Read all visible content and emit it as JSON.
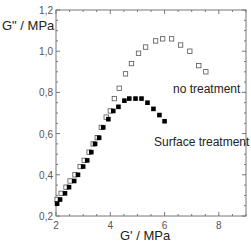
{
  "chart_data": {
    "type": "scatter",
    "title": "",
    "xlabel": "G' / MPa",
    "ylabel": "G\" / MPa",
    "xlim": [
      2,
      9
    ],
    "ylim": [
      0.2,
      1.2
    ],
    "xticks": [
      2,
      4,
      6,
      8
    ],
    "xtick_labels": [
      "2",
      "4",
      "6",
      "8"
    ],
    "yticks": [
      0.2,
      0.4,
      0.6,
      0.8,
      1.0,
      1.2
    ],
    "ytick_labels": [
      "0,2",
      "0,4",
      "0,6",
      "0,8",
      "1,0",
      "1,2"
    ],
    "grid": false,
    "legend": "none (series labeled by in-plot annotations)",
    "series": [
      {
        "name": "no treatment",
        "marker": "open-square",
        "color": "#555555",
        "x": [
          2.04,
          2.19,
          2.37,
          2.52,
          2.7,
          2.89,
          3.04,
          3.22,
          3.37,
          3.52,
          3.67,
          3.85,
          4.0,
          4.15,
          4.33,
          4.56,
          4.78,
          5.04,
          5.3,
          5.67,
          5.93,
          6.26,
          6.59,
          6.93,
          7.26,
          7.52
        ],
        "y": [
          0.28,
          0.31,
          0.34,
          0.37,
          0.4,
          0.44,
          0.47,
          0.51,
          0.55,
          0.58,
          0.63,
          0.68,
          0.71,
          0.77,
          0.82,
          0.89,
          0.94,
          0.99,
          1.02,
          1.05,
          1.06,
          1.06,
          1.03,
          1.0,
          0.93,
          0.9
        ]
      },
      {
        "name": "Surface treatment",
        "marker": "filled-square",
        "color": "#000000",
        "x": [
          2.04,
          2.15,
          2.33,
          2.48,
          2.67,
          2.81,
          3.0,
          3.15,
          3.3,
          3.44,
          3.59,
          3.74,
          3.93,
          4.11,
          4.3,
          4.52,
          4.7,
          4.93,
          5.15,
          5.37,
          5.59,
          5.81,
          6.0
        ],
        "y": [
          0.26,
          0.28,
          0.31,
          0.34,
          0.37,
          0.4,
          0.44,
          0.47,
          0.51,
          0.55,
          0.58,
          0.63,
          0.67,
          0.71,
          0.73,
          0.76,
          0.77,
          0.77,
          0.77,
          0.75,
          0.72,
          0.69,
          0.66
        ]
      }
    ],
    "annotations": [
      {
        "text": "no treatment",
        "x": 6.4,
        "y": 0.84
      },
      {
        "text": "Surface treatment",
        "x": 5.3,
        "y": 0.6
      }
    ]
  },
  "axes": {
    "xlabel": "G' / MPa",
    "ylabel": "G\" / MPa"
  },
  "labels": {
    "no_treatment": "no treatment",
    "surface_treatment": "Surface treatment"
  }
}
